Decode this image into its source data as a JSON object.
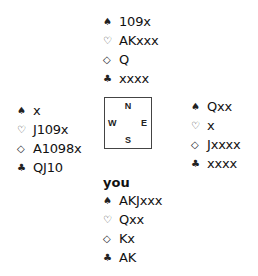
{
  "suits": {
    "spades": "♠",
    "hearts": "♡",
    "diamonds": "◇",
    "clubs": "♣"
  },
  "north": {
    "spades": "109x",
    "hearts": "AKxxx",
    "diamonds": "Q",
    "clubs": "xxxx"
  },
  "west": {
    "spades": "x",
    "hearts": "J109x",
    "diamonds": "A1098x",
    "clubs": "QJ10"
  },
  "east": {
    "spades": "Qxx",
    "hearts": "x",
    "diamonds": "Jxxxx",
    "clubs": "xxxx"
  },
  "south": {
    "label": "you",
    "spades": "AKJxxx",
    "hearts": "Qxx",
    "diamonds": "Kx",
    "clubs": "AK"
  },
  "compass": {
    "n": "N",
    "s": "S",
    "e": "E",
    "w": "W"
  }
}
